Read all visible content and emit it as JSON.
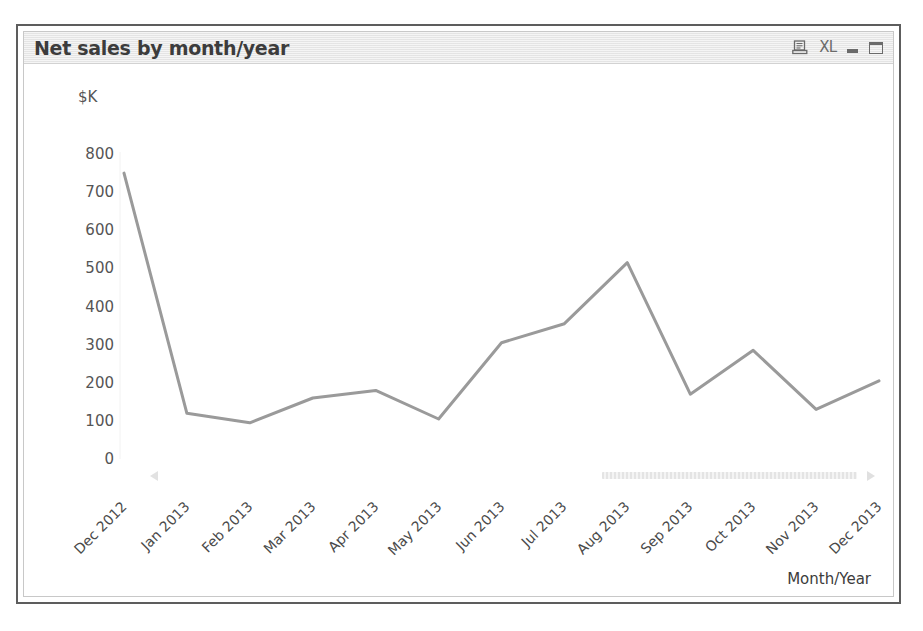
{
  "window": {
    "title": "Net sales by month/year",
    "controls": [
      {
        "name": "export-report-icon",
        "label": ""
      },
      {
        "name": "export-excel-icon",
        "label": "XL"
      },
      {
        "name": "minimize-button",
        "label": ""
      },
      {
        "name": "maximize-button",
        "label": ""
      }
    ]
  },
  "axis": {
    "y_unit": "$K",
    "x_title": "Month/Year"
  },
  "scrollbar": {
    "left_arrow": "◀",
    "right_arrow": "▶"
  },
  "colors": {
    "line": "#9a9a9a",
    "titlebar": "#e9e9e9",
    "frame": "#5d5d5d",
    "text": "#555555",
    "plot_bg": "#ffffff"
  },
  "chart_data": {
    "type": "line",
    "title": "Net sales by month/year",
    "xlabel": "Month/Year",
    "ylabel": "$K",
    "ylim": [
      0,
      800
    ],
    "yticks": [
      0,
      100,
      200,
      300,
      400,
      500,
      600,
      700,
      800
    ],
    "grid": false,
    "legend": null,
    "categories": [
      "Dec 2012",
      "Jan 2013",
      "Feb 2013",
      "Mar 2013",
      "Apr 2013",
      "May 2013",
      "Jun 2013",
      "Jul 2013",
      "Aug 2013",
      "Sep 2013",
      "Oct 2013",
      "Nov 2013",
      "Dec 2013"
    ],
    "values": [
      750,
      120,
      95,
      160,
      180,
      105,
      305,
      355,
      515,
      170,
      285,
      130,
      205
    ],
    "series": [
      {
        "name": "Net sales",
        "values": [
          750,
          120,
          95,
          160,
          180,
          105,
          305,
          355,
          515,
          170,
          285,
          130,
          205
        ]
      }
    ]
  }
}
